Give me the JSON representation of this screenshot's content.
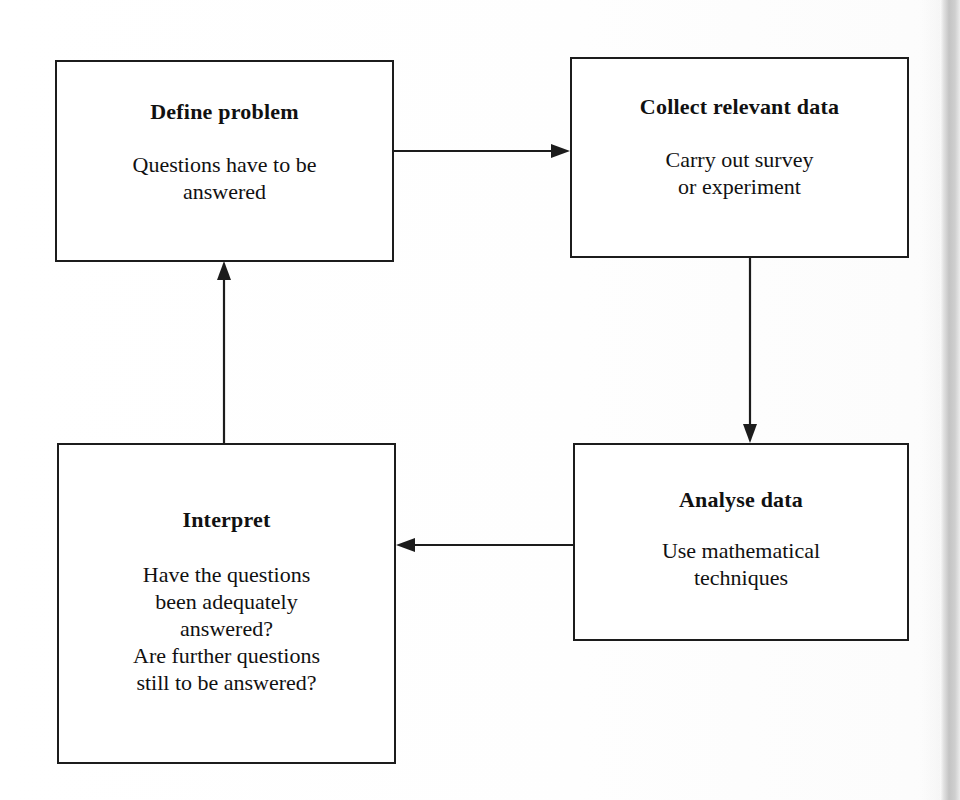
{
  "diagram": {
    "background_color": "#ffffff",
    "line_color": "#1c1c1c",
    "text_color": "#111111",
    "nodes": [
      {
        "id": "define",
        "title": "Define problem",
        "body": "Questions have to be\nanswered"
      },
      {
        "id": "collect",
        "title": "Collect relevant data",
        "body": "Carry out survey\nor experiment"
      },
      {
        "id": "analyse",
        "title": "Analyse data",
        "body": "Use mathematical\ntechniques"
      },
      {
        "id": "interpret",
        "title": "Interpret",
        "body": "Have the questions\nbeen adequately\nanswered?\nAre further questions\nstill to be answered?"
      }
    ],
    "edges": [
      {
        "id": "define-to-collect",
        "from": "define",
        "to": "collect",
        "direction": "right"
      },
      {
        "id": "collect-to-analyse",
        "from": "collect",
        "to": "analyse",
        "direction": "down"
      },
      {
        "id": "analyse-to-interpret",
        "from": "analyse",
        "to": "interpret",
        "direction": "left"
      },
      {
        "id": "interpret-to-define",
        "from": "interpret",
        "to": "define",
        "direction": "up"
      }
    ]
  }
}
